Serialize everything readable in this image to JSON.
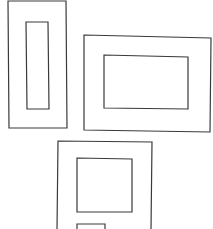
{
  "canvas": {
    "width": 213,
    "height": 229,
    "background": "#ffffff",
    "stroke": "#3a3a3a"
  },
  "shapes": [
    {
      "name": "frame-tall-outer",
      "points": [
        [
          8,
          1
        ],
        [
          66,
          1
        ],
        [
          67,
          128
        ],
        [
          9,
          128
        ]
      ]
    },
    {
      "name": "frame-tall-inner",
      "points": [
        [
          26,
          22
        ],
        [
          48,
          22
        ],
        [
          49,
          109
        ],
        [
          27,
          109
        ]
      ]
    },
    {
      "name": "frame-wide-outer",
      "points": [
        [
          84,
          35
        ],
        [
          211,
          38
        ],
        [
          210,
          132
        ],
        [
          84,
          130
        ]
      ]
    },
    {
      "name": "frame-wide-inner",
      "points": [
        [
          104,
          55
        ],
        [
          188,
          57
        ],
        [
          188,
          109
        ],
        [
          104,
          108
        ]
      ]
    },
    {
      "name": "frame-bottom-outer",
      "points": [
        [
          57,
          230
        ],
        [
          58,
          141
        ],
        [
          152,
          142
        ],
        [
          151,
          230
        ]
      ]
    },
    {
      "name": "frame-bottom-inner-square",
      "points": [
        [
          77,
          158
        ],
        [
          132,
          159
        ],
        [
          132,
          212
        ],
        [
          77,
          212
        ]
      ]
    },
    {
      "name": "frame-bottom-inner-small",
      "points": [
        [
          77,
          230
        ],
        [
          77,
          224
        ],
        [
          105,
          224
        ],
        [
          105,
          230
        ]
      ]
    }
  ]
}
